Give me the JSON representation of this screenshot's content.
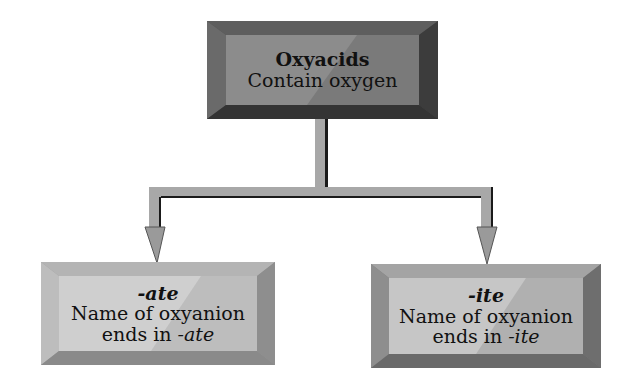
{
  "diagram": {
    "root": {
      "title": "Oxyacids",
      "subtitle": "Contain oxygen",
      "tone": "#8a8a8a"
    },
    "children": [
      {
        "title": "-ate",
        "line1": "Name of oxyanion",
        "line2_prefix": "ends in ",
        "line2_suffix": "-ate",
        "tone": "#c4c4c4"
      },
      {
        "title": "-ite",
        "line1": "Name of oxyanion",
        "line2_prefix": "ends in ",
        "line2_suffix": "-ite",
        "tone": "#b8b8b8"
      }
    ],
    "connector_color": "#a8a8a8",
    "connector_shadow": "#1a1a1a"
  }
}
